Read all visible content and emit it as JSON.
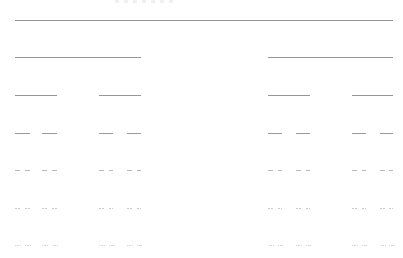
{
  "diagram": {
    "type": "cantor-set-construction",
    "line_color": "#8a8a8a",
    "levels": [
      {
        "y": 20,
        "opacity": 0.9,
        "segments": [
          [
            15,
            393
          ]
        ]
      },
      {
        "y": 57,
        "opacity": 0.9,
        "segments": [
          [
            15,
            141
          ],
          [
            268,
            393
          ]
        ]
      },
      {
        "y": 95,
        "opacity": 0.9,
        "segments": [
          [
            15,
            57
          ],
          [
            99,
            141
          ],
          [
            268,
            310
          ],
          [
            352,
            393
          ]
        ]
      },
      {
        "y": 133,
        "opacity": 0.85,
        "segments": [
          [
            15,
            30
          ],
          [
            42,
            57
          ],
          [
            99,
            113
          ],
          [
            127,
            141
          ],
          [
            268,
            282
          ],
          [
            296,
            310
          ],
          [
            352,
            366
          ],
          [
            380,
            393
          ]
        ]
      },
      {
        "y": 170,
        "opacity": 0.6,
        "segments": [
          [
            15,
            20
          ],
          [
            25,
            30
          ],
          [
            42,
            47
          ],
          [
            52,
            57
          ],
          [
            99,
            104
          ],
          [
            109,
            113
          ],
          [
            127,
            132
          ],
          [
            137,
            141
          ],
          [
            268,
            273
          ],
          [
            278,
            282
          ],
          [
            296,
            301
          ],
          [
            306,
            310
          ],
          [
            352,
            357
          ],
          [
            362,
            366
          ],
          [
            380,
            385
          ],
          [
            389,
            393
          ]
        ]
      },
      {
        "y": 208,
        "opacity": 0.45,
        "segments": [
          [
            15,
            17
          ],
          [
            18,
            20
          ],
          [
            25,
            27
          ],
          [
            28,
            30
          ],
          [
            42,
            44
          ],
          [
            45,
            47
          ],
          [
            52,
            54
          ],
          [
            55,
            57
          ],
          [
            99,
            101
          ],
          [
            102,
            104
          ],
          [
            109,
            111
          ],
          [
            112,
            113
          ],
          [
            127,
            129
          ],
          [
            130,
            132
          ],
          [
            137,
            139
          ],
          [
            140,
            141
          ],
          [
            268,
            270
          ],
          [
            271,
            273
          ],
          [
            278,
            280
          ],
          [
            281,
            282
          ],
          [
            296,
            298
          ],
          [
            299,
            301
          ],
          [
            306,
            308
          ],
          [
            309,
            310
          ],
          [
            352,
            354
          ],
          [
            355,
            357
          ],
          [
            362,
            364
          ],
          [
            365,
            366
          ],
          [
            380,
            382
          ],
          [
            383,
            385
          ],
          [
            389,
            391
          ],
          [
            392,
            393
          ]
        ]
      },
      {
        "y": 245,
        "opacity": 0.35,
        "segments": [
          [
            15,
            16
          ],
          [
            17,
            17.5
          ],
          [
            18,
            19
          ],
          [
            19.5,
            20
          ],
          [
            25,
            26
          ],
          [
            27,
            27.5
          ],
          [
            28,
            29
          ],
          [
            29.5,
            30
          ],
          [
            42,
            43
          ],
          [
            44,
            44.5
          ],
          [
            45,
            46
          ],
          [
            46.5,
            47
          ],
          [
            52,
            53
          ],
          [
            54,
            54.5
          ],
          [
            55,
            56
          ],
          [
            56.5,
            57
          ],
          [
            99,
            100
          ],
          [
            101,
            101.5
          ],
          [
            102,
            103
          ],
          [
            103.5,
            104
          ],
          [
            109,
            110
          ],
          [
            111,
            111.5
          ],
          [
            112,
            112.5
          ],
          [
            113,
            113.5
          ],
          [
            127,
            128
          ],
          [
            129,
            129.5
          ],
          [
            130,
            131
          ],
          [
            131.5,
            132
          ],
          [
            137,
            138
          ],
          [
            139,
            139.5
          ],
          [
            140,
            140.5
          ],
          [
            141,
            141.5
          ],
          [
            268,
            269
          ],
          [
            270,
            270.5
          ],
          [
            271,
            272
          ],
          [
            272.5,
            273
          ],
          [
            278,
            279
          ],
          [
            280,
            280.5
          ],
          [
            281,
            281.5
          ],
          [
            282,
            282.5
          ],
          [
            296,
            297
          ],
          [
            298,
            298.5
          ],
          [
            299,
            300
          ],
          [
            300.5,
            301
          ],
          [
            306,
            307
          ],
          [
            308,
            308.5
          ],
          [
            309,
            309.5
          ],
          [
            310,
            310.5
          ],
          [
            352,
            353
          ],
          [
            354,
            354.5
          ],
          [
            355,
            356
          ],
          [
            356.5,
            357
          ],
          [
            362,
            363
          ],
          [
            364,
            364.5
          ],
          [
            365,
            365.5
          ],
          [
            366,
            366.5
          ],
          [
            380,
            381
          ],
          [
            382,
            382.5
          ],
          [
            383,
            384
          ],
          [
            384.5,
            385
          ],
          [
            389,
            390
          ],
          [
            391,
            391.5
          ],
          [
            392,
            392.5
          ],
          [
            393,
            393.5
          ]
        ]
      }
    ]
  }
}
